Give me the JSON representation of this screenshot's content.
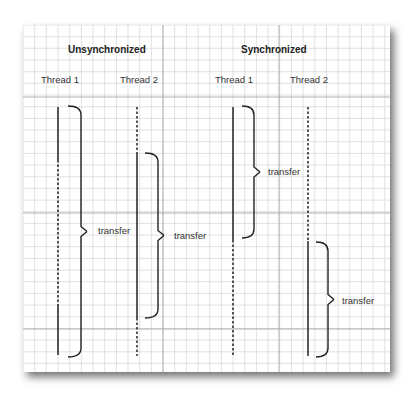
{
  "diagram": {
    "sections": [
      {
        "title": "Unsynchronized",
        "thread1_label": "Thread 1",
        "thread2_label": "Thread 2",
        "brace1_label": "transfer",
        "brace2_label": "transfer"
      },
      {
        "title": "Synchronized",
        "thread1_label": "Thread 1",
        "thread2_label": "Thread 2",
        "brace1_label": "transfer",
        "brace2_label": "transfer"
      }
    ],
    "colors": {
      "grid_minor": "#d4d4d4",
      "grid_major": "#a8a8a8",
      "line": "#222222"
    }
  }
}
